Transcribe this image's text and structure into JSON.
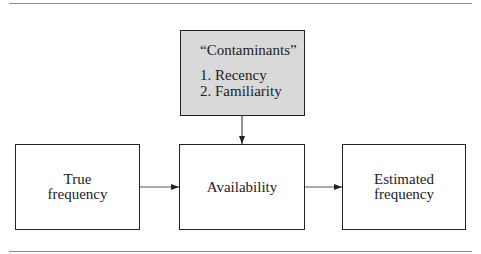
{
  "diagram": {
    "contaminants": {
      "title": "“Contaminants”",
      "items": [
        "1. Recency",
        "2. Familiarity"
      ],
      "fill": "#d9d9d9"
    },
    "nodes": [
      {
        "id": "true-frequency",
        "line1": "True",
        "line2": "frequency"
      },
      {
        "id": "availability",
        "label": "Availability"
      },
      {
        "id": "estimated-frequency",
        "line1": "Estimated",
        "line2": "frequency"
      }
    ],
    "edges": [
      {
        "from": "contaminants",
        "to": "availability"
      },
      {
        "from": "true-frequency",
        "to": "availability"
      },
      {
        "from": "availability",
        "to": "estimated-frequency"
      }
    ]
  }
}
